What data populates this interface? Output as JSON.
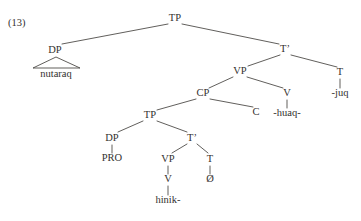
{
  "figure": {
    "example_number": "(13)",
    "example_number_x": 8,
    "example_number_y": 26,
    "width": 361,
    "height": 221,
    "line_color": "#45423f",
    "text_color": "#33312f",
    "background_color": "#ffffff"
  },
  "tree": {
    "nodes": [
      {
        "id": "tp-root",
        "label": "TP",
        "x": 175,
        "y": 21,
        "kind": "nonterminal"
      },
      {
        "id": "dp-subject",
        "label": "DP",
        "x": 55,
        "y": 53,
        "kind": "nonterminal"
      },
      {
        "id": "nutaraq",
        "label": "nutaraq",
        "x": 56,
        "y": 77,
        "kind": "terminal"
      },
      {
        "id": "tbar-main",
        "label": "T’",
        "x": 285,
        "y": 52,
        "kind": "nonterminal"
      },
      {
        "id": "vp-main",
        "label": "VP",
        "x": 240,
        "y": 74,
        "kind": "nonterminal"
      },
      {
        "id": "t-main",
        "label": "T",
        "x": 340,
        "y": 75,
        "kind": "nonterminal"
      },
      {
        "id": "juq",
        "label": "-juq",
        "x": 340,
        "y": 96,
        "kind": "terminal"
      },
      {
        "id": "cp",
        "label": "CP",
        "x": 203,
        "y": 96,
        "kind": "nonterminal"
      },
      {
        "id": "v-main",
        "label": "V",
        "x": 287,
        "y": 96,
        "kind": "nonterminal"
      },
      {
        "id": "huaq",
        "label": "-huaq-",
        "x": 287,
        "y": 116,
        "kind": "terminal"
      },
      {
        "id": "tp-embed",
        "label": "TP",
        "x": 150,
        "y": 118,
        "kind": "nonterminal"
      },
      {
        "id": "c",
        "label": "C",
        "x": 256,
        "y": 115,
        "kind": "nonterminal"
      },
      {
        "id": "dp-pro",
        "label": "DP",
        "x": 112,
        "y": 141,
        "kind": "nonterminal"
      },
      {
        "id": "pro",
        "label": "PRO",
        "x": 112,
        "y": 161,
        "kind": "terminal"
      },
      {
        "id": "tbar-embed",
        "label": "T’",
        "x": 192,
        "y": 141,
        "kind": "nonterminal"
      },
      {
        "id": "vp-embed",
        "label": "VP",
        "x": 168,
        "y": 162,
        "kind": "nonterminal"
      },
      {
        "id": "t-embed",
        "label": "T",
        "x": 210,
        "y": 162,
        "kind": "nonterminal"
      },
      {
        "id": "v-embed",
        "label": "V",
        "x": 168,
        "y": 182,
        "kind": "nonterminal"
      },
      {
        "id": "null-morph",
        "label": "Ø",
        "x": 210,
        "y": 182,
        "kind": "terminal"
      },
      {
        "id": "hinik",
        "label": "hinik-",
        "x": 168,
        "y": 203,
        "kind": "terminal"
      }
    ],
    "branches": [
      {
        "id": "tp-root-to-dp",
        "x1": 168,
        "y1": 24,
        "x2": 62,
        "y2": 44
      },
      {
        "id": "tp-root-to-tbar",
        "x1": 182,
        "y1": 24,
        "x2": 279,
        "y2": 44
      },
      {
        "id": "tbar-to-vp",
        "x1": 280,
        "y1": 55,
        "x2": 248,
        "y2": 66
      },
      {
        "id": "tbar-to-t",
        "x1": 291,
        "y1": 55,
        "x2": 337,
        "y2": 67
      },
      {
        "id": "vp-to-cp",
        "x1": 233,
        "y1": 77,
        "x2": 209,
        "y2": 88
      },
      {
        "id": "vp-to-v",
        "x1": 247,
        "y1": 77,
        "x2": 283,
        "y2": 88
      },
      {
        "id": "cp-to-tp",
        "x1": 196,
        "y1": 99,
        "x2": 157,
        "y2": 110
      },
      {
        "id": "cp-to-c",
        "x1": 210,
        "y1": 99,
        "x2": 253,
        "y2": 107
      },
      {
        "id": "tp-embed-to-dp",
        "x1": 143,
        "y1": 121,
        "x2": 118,
        "y2": 132
      },
      {
        "id": "tp-embed-to-tbar",
        "x1": 157,
        "y1": 121,
        "x2": 187,
        "y2": 132
      },
      {
        "id": "tbar-embed-to-vp",
        "x1": 187,
        "y1": 144,
        "x2": 172,
        "y2": 153
      },
      {
        "id": "tbar-embed-to-t",
        "x1": 197,
        "y1": 144,
        "x2": 208,
        "y2": 153
      }
    ],
    "stems": [
      {
        "id": "t-main-stem",
        "x": 340,
        "y1": 79,
        "y2": 88
      },
      {
        "id": "v-main-stem",
        "x": 287,
        "y1": 100,
        "y2": 108
      },
      {
        "id": "dp-pro-stem",
        "x": 112,
        "y1": 145,
        "y2": 153
      },
      {
        "id": "vp-embed-stem",
        "x": 168,
        "y1": 166,
        "y2": 174
      },
      {
        "id": "t-embed-stem",
        "x": 210,
        "y1": 166,
        "y2": 174
      },
      {
        "id": "v-embed-stem",
        "x": 168,
        "y1": 186,
        "y2": 195
      }
    ],
    "triangles": [
      {
        "id": "dp-subject-triangle",
        "apex_x": 56,
        "apex_y": 57,
        "left_x": 33,
        "right_x": 80,
        "base_y": 68
      }
    ]
  }
}
